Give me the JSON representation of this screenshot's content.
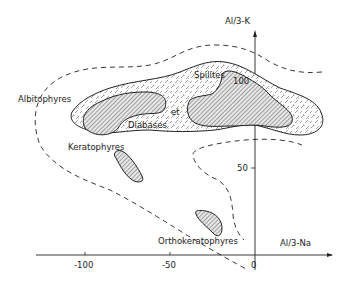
{
  "axes": {
    "x_label": "Al/3-Na",
    "y_label": "Al/3-K",
    "x_ticks": [
      "-100",
      "-50",
      "0"
    ],
    "y_ticks": [
      "50",
      "100"
    ]
  },
  "fields": {
    "albitophyres": "Albitophyres",
    "spilites": "Spilites",
    "et": "et",
    "diabases": "Diabases",
    "keratophyres": "Keratophyres",
    "orthokeratophyres": "Orthokeratophyres"
  },
  "colors": {
    "ink": "#222222",
    "background": "#ffffff"
  }
}
